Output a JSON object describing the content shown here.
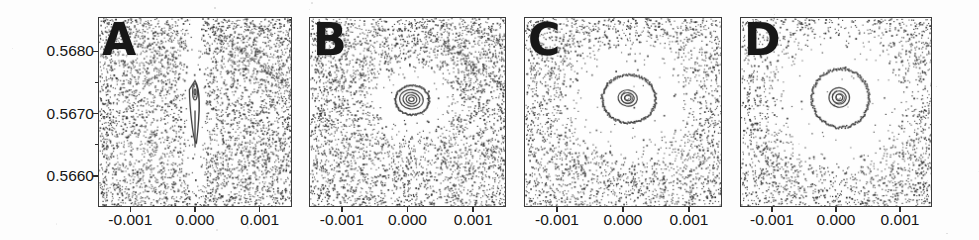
{
  "figure": {
    "width": 979,
    "height": 240,
    "background_color": "#fdfdfd",
    "ink_color": "#333333"
  },
  "chart_data": {
    "type": "scatter",
    "title": "",
    "subtitle": "",
    "xlabel": "",
    "ylabel": "",
    "grid": false,
    "legend_position": "none",
    "shared_axes": {
      "xlim": [
        -0.0015,
        0.0015
      ],
      "ylim": [
        0.5655,
        0.56855
      ],
      "xticks": [
        -0.001,
        0.0,
        0.001
      ],
      "xtick_labels": [
        "-0.001",
        "0.000",
        "0.001"
      ],
      "yticks": [
        0.568,
        0.567,
        0.566
      ],
      "ytick_labels": [
        "0.5680",
        "0.5670",
        "0.5660"
      ],
      "ytick_labels_on_panel": "A"
    },
    "panels": [
      {
        "id": "A",
        "label": "A",
        "left_px": 98,
        "width_px": 194,
        "island_center": [
          0.0,
          0.56718
        ],
        "island_shape": "narrow teardrop with downward spike",
        "island_width": 0.00014,
        "island_height": 0.0013,
        "contour_rings": 2,
        "chaotic_sea_density": 0.82,
        "point_count": 5400
      },
      {
        "id": "B",
        "label": "B",
        "left_px": 309,
        "width_px": 197,
        "island_center": [
          6e-05,
          0.56723
        ],
        "island_shape": "compact concentric rings",
        "island_width": 0.00052,
        "island_height": 0.00048,
        "contour_rings": 4,
        "chaotic_sea_density": 0.78,
        "point_count": 5200
      },
      {
        "id": "C",
        "label": "C",
        "left_px": 524,
        "width_px": 198,
        "island_center": [
          8e-05,
          0.56725
        ],
        "island_shape": "large ring with small core",
        "island_width": 0.00082,
        "island_height": 0.00078,
        "contour_rings": 3,
        "chaotic_sea_density": 0.7,
        "point_count": 4900
      },
      {
        "id": "D",
        "label": "D",
        "left_px": 740,
        "width_px": 192,
        "island_center": [
          6e-05,
          0.56726
        ],
        "island_shape": "large oval ring with small spiral core",
        "island_width": 0.0009,
        "island_height": 0.00095,
        "contour_rings": 3,
        "chaotic_sea_density": 0.66,
        "point_count": 4700
      }
    ]
  }
}
